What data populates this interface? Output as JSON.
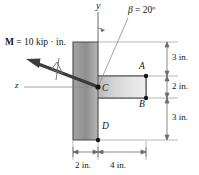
{
  "figure": {
    "type": "cross-section-diagram",
    "axes": {
      "y_label": "y",
      "z_label": "z"
    },
    "angle": {
      "symbol": "β",
      "equals": "=",
      "value": "20º",
      "full": "β = 20º",
      "degrees": 20,
      "measured_from": "y-axis"
    },
    "moment": {
      "symbol": "M",
      "rest": " = 10 kip · in.",
      "full": "M = 10 kip · in.",
      "magnitude": 10,
      "units": "kip · in.",
      "notation": "double-headed-vector"
    },
    "points": [
      {
        "id": "A",
        "label": "A"
      },
      {
        "id": "B",
        "label": "B"
      },
      {
        "id": "C",
        "label": "C"
      },
      {
        "id": "D",
        "label": "D"
      }
    ],
    "dimensions": {
      "vertical": [
        {
          "label": "3 in.",
          "value": 3,
          "units": "in."
        },
        {
          "label": "2 in.",
          "value": 2,
          "units": "in."
        },
        {
          "label": "3 in.",
          "value": 3,
          "units": "in."
        }
      ],
      "horizontal": [
        {
          "label": "2 in.",
          "value": 2,
          "units": "in."
        },
        {
          "label": "4 in.",
          "value": 4,
          "units": "in."
        }
      ]
    },
    "colors": {
      "outline": "#4a4a4a",
      "fill_light": "#f2f2f2",
      "fill_dark": "#9a9a9a",
      "arrow": "#3c3c3c",
      "dimension_line": "#8c8c8c",
      "text": "#151515"
    }
  }
}
